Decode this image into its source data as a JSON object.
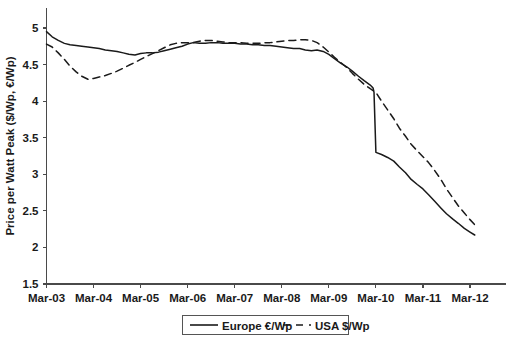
{
  "chart_data": {
    "type": "line",
    "title": "",
    "xlabel": "",
    "ylabel": "Price per Watt Peak ($/Wp, €/Wp)",
    "ylim": [
      1.5,
      5.0
    ],
    "yticks": [
      1.5,
      2,
      2.5,
      3,
      3.5,
      4,
      4.5,
      5
    ],
    "ytick_labels": [
      "1.5",
      "2",
      "2.5",
      "3",
      "3.5",
      "4",
      "4.5",
      "5"
    ],
    "xtick_labels": [
      "Mar-03",
      "Mar-04",
      "Mar-05",
      "Mar-06",
      "Mar-07",
      "Mar-08",
      "Mar-09",
      "Mar-10",
      "Mar-11",
      "Mar-12"
    ],
    "xlim": [
      "Mar-03",
      "Mar-12"
    ],
    "grid": false,
    "legend_position": "bottom-center",
    "series": [
      {
        "name": "Europe €/Wp",
        "style": "solid",
        "color": "#1a1a1a",
        "x": [
          0.0,
          0.12,
          0.25,
          0.38,
          0.5,
          0.63,
          0.75,
          0.88,
          1.0,
          1.12,
          1.25,
          1.38,
          1.5,
          1.63,
          1.75,
          1.88,
          2.0,
          2.12,
          2.25,
          2.38,
          2.5,
          2.63,
          2.75,
          2.88,
          3.0,
          3.12,
          3.25,
          3.38,
          3.5,
          3.63,
          3.75,
          3.88,
          4.0,
          4.12,
          4.25,
          4.38,
          4.5,
          4.63,
          4.75,
          4.88,
          5.0,
          5.12,
          5.25,
          5.38,
          5.5,
          5.63,
          5.75,
          5.88,
          6.0,
          6.12,
          6.25,
          6.38,
          6.5,
          6.63,
          6.75,
          6.88,
          6.94,
          6.96,
          7.0,
          7.12,
          7.25,
          7.38,
          7.5,
          7.63,
          7.75,
          7.88,
          8.0,
          8.12,
          8.25,
          8.38,
          8.5,
          8.63,
          8.75,
          8.88,
          9.0,
          9.1
        ],
        "y": [
          4.95,
          4.88,
          4.83,
          4.79,
          4.77,
          4.76,
          4.75,
          4.74,
          4.73,
          4.72,
          4.7,
          4.69,
          4.68,
          4.66,
          4.64,
          4.63,
          4.65,
          4.66,
          4.66,
          4.67,
          4.69,
          4.71,
          4.73,
          4.75,
          4.78,
          4.8,
          4.79,
          4.79,
          4.8,
          4.8,
          4.79,
          4.79,
          4.79,
          4.78,
          4.78,
          4.77,
          4.77,
          4.76,
          4.76,
          4.75,
          4.74,
          4.73,
          4.72,
          4.72,
          4.7,
          4.69,
          4.7,
          4.68,
          4.64,
          4.58,
          4.52,
          4.47,
          4.41,
          4.34,
          4.28,
          4.22,
          4.18,
          4.12,
          3.3,
          3.27,
          3.23,
          3.18,
          3.1,
          3.02,
          2.93,
          2.86,
          2.8,
          2.72,
          2.63,
          2.54,
          2.46,
          2.39,
          2.33,
          2.26,
          2.21,
          2.17
        ],
        "start_value": 4.95,
        "min_value": 2.17,
        "end_value": 2.17
      },
      {
        "name": "USA $/Wp",
        "style": "dashed",
        "color": "#1a1a1a",
        "x": [
          0.0,
          0.12,
          0.25,
          0.38,
          0.5,
          0.63,
          0.75,
          0.88,
          1.0,
          1.12,
          1.25,
          1.38,
          1.5,
          1.63,
          1.75,
          1.88,
          2.0,
          2.12,
          2.25,
          2.38,
          2.5,
          2.63,
          2.75,
          2.88,
          3.0,
          3.12,
          3.25,
          3.38,
          3.5,
          3.63,
          3.75,
          3.88,
          4.0,
          4.12,
          4.25,
          4.38,
          4.5,
          4.63,
          4.75,
          4.88,
          5.0,
          5.12,
          5.25,
          5.38,
          5.5,
          5.63,
          5.75,
          5.88,
          6.0,
          6.12,
          6.25,
          6.38,
          6.5,
          6.63,
          6.75,
          6.88,
          7.0,
          7.12,
          7.25,
          7.38,
          7.5,
          7.63,
          7.75,
          7.88,
          8.0,
          8.12,
          8.25,
          8.38,
          8.5,
          8.63,
          8.75,
          8.88,
          9.0,
          9.1
        ],
        "y": [
          4.78,
          4.74,
          4.66,
          4.57,
          4.48,
          4.4,
          4.34,
          4.3,
          4.31,
          4.33,
          4.35,
          4.38,
          4.41,
          4.45,
          4.49,
          4.53,
          4.57,
          4.61,
          4.65,
          4.69,
          4.73,
          4.77,
          4.79,
          4.8,
          4.8,
          4.8,
          4.82,
          4.83,
          4.83,
          4.82,
          4.81,
          4.8,
          4.8,
          4.8,
          4.79,
          4.79,
          4.79,
          4.8,
          4.8,
          4.81,
          4.82,
          4.83,
          4.83,
          4.84,
          4.84,
          4.83,
          4.8,
          4.74,
          4.67,
          4.6,
          4.53,
          4.46,
          4.38,
          4.3,
          4.23,
          4.17,
          4.12,
          4.0,
          3.88,
          3.76,
          3.63,
          3.52,
          3.41,
          3.32,
          3.24,
          3.16,
          3.05,
          2.93,
          2.8,
          2.68,
          2.57,
          2.47,
          2.38,
          2.31
        ],
        "start_value": 4.78,
        "min_value": 2.31,
        "end_value": 2.31
      }
    ]
  },
  "legend": {
    "items": [
      {
        "label": "Europe €/Wp",
        "style": "solid"
      },
      {
        "label": "USA $/Wp",
        "style": "dashed"
      }
    ]
  }
}
